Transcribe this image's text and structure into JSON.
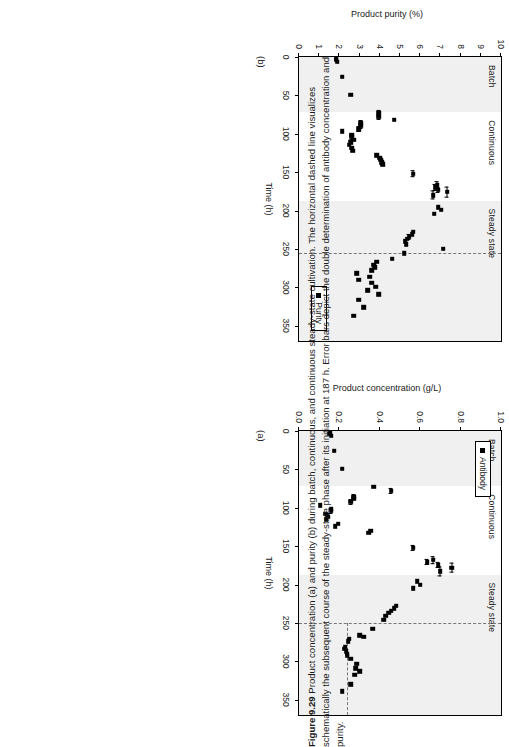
{
  "figure": {
    "number": "Figure 9.29",
    "caption_text": " Product concentration (a) and purity (b) during batch, continuous, and continuous steady-state cultivation. The horizontal dashed line visualizes schematically the subsequent course of the steady-state phase after its initiation at 187 h. Error bars depict the double determination of antibody concentration and purity."
  },
  "panel_a": {
    "tag": "(a)",
    "legend_label": "Antibody",
    "bands": [
      {
        "label": "Batch"
      },
      {
        "label": "Continuous"
      },
      {
        "label": "Steady state"
      }
    ],
    "xticks": [
      "0",
      "50",
      "100",
      "150",
      "200",
      "250",
      "300",
      "350"
    ],
    "yticks": [
      "0.0",
      "0.2",
      "0.4",
      "0.6",
      "0.8",
      "1.0"
    ]
  },
  "panel_b": {
    "tag": "(b)",
    "legend_label": "Purity",
    "bands": [
      {
        "label": "Batch"
      },
      {
        "label": "Continuous"
      },
      {
        "label": "Steady state"
      }
    ],
    "xticks": [
      "0",
      "50",
      "100",
      "150",
      "200",
      "250",
      "300",
      "350"
    ],
    "yticks": [
      "0",
      "1",
      "2",
      "3",
      "4",
      "5",
      "6",
      "7",
      "8",
      "9",
      "10"
    ]
  },
  "chart_data": [
    {
      "type": "scatter",
      "panel": "(a)",
      "title": "",
      "xlabel": "Time (h)",
      "ylabel": "Product concentration (g/L)",
      "xlim": [
        0,
        370
      ],
      "ylim": [
        0.0,
        1.0
      ],
      "grid": false,
      "legend_position": "top-left",
      "series": [
        {
          "name": "Antibody",
          "marker": "filled-square",
          "color": "#000000",
          "points": [
            {
              "x": 2,
              "y": 0.155
            },
            {
              "x": 4,
              "y": 0.15
            },
            {
              "x": 6,
              "y": 0.16
            },
            {
              "x": 26,
              "y": 0.175
            },
            {
              "x": 49,
              "y": 0.215
            },
            {
              "x": 73,
              "y": 0.37,
              "xerr": 0
            },
            {
              "x": 78,
              "y": 0.455,
              "xerr": 4
            },
            {
              "x": 86,
              "y": 0.27,
              "xerr": 3
            },
            {
              "x": 88,
              "y": 0.27
            },
            {
              "x": 92,
              "y": 0.255,
              "xerr": 3
            },
            {
              "x": 97,
              "y": 0.105
            },
            {
              "x": 101,
              "y": 0.16
            },
            {
              "x": 104,
              "y": 0.16,
              "xerr": 3
            },
            {
              "x": 108,
              "y": 0.13
            },
            {
              "x": 110,
              "y": 0.14
            },
            {
              "x": 112,
              "y": 0.145
            },
            {
              "x": 115,
              "y": 0.135
            },
            {
              "x": 121,
              "y": 0.195
            },
            {
              "x": 124,
              "y": 0.18
            },
            {
              "x": 130,
              "y": 0.355
            },
            {
              "x": 133,
              "y": 0.345
            },
            {
              "x": 152,
              "y": 0.565,
              "xerr": 4
            },
            {
              "x": 168,
              "y": 0.665,
              "xerr": 5
            },
            {
              "x": 171,
              "y": 0.635,
              "xerr": 4
            },
            {
              "x": 175,
              "y": 0.69,
              "xerr": 4
            },
            {
              "x": 178,
              "y": 0.755,
              "xerr": 7
            },
            {
              "x": 183,
              "y": 0.7,
              "xerr": 6
            },
            {
              "x": 196,
              "y": 0.585
            },
            {
              "x": 200,
              "y": 0.6
            },
            {
              "x": 205,
              "y": 0.565
            },
            {
              "x": 228,
              "y": 0.48
            },
            {
              "x": 231,
              "y": 0.47
            },
            {
              "x": 234,
              "y": 0.455
            },
            {
              "x": 237,
              "y": 0.445
            },
            {
              "x": 241,
              "y": 0.43
            },
            {
              "x": 246,
              "y": 0.42
            },
            {
              "x": 258,
              "y": 0.365
            },
            {
              "x": 266,
              "y": 0.3
            },
            {
              "x": 268,
              "y": 0.32
            },
            {
              "x": 271,
              "y": 0.25
            },
            {
              "x": 274,
              "y": 0.245
            },
            {
              "x": 281,
              "y": 0.23
            },
            {
              "x": 284,
              "y": 0.225
            },
            {
              "x": 287,
              "y": 0.235
            },
            {
              "x": 290,
              "y": 0.24
            },
            {
              "x": 293,
              "y": 0.24
            },
            {
              "x": 297,
              "y": 0.255
            },
            {
              "x": 303,
              "y": 0.285
            },
            {
              "x": 309,
              "y": 0.28
            },
            {
              "x": 313,
              "y": 0.3
            },
            {
              "x": 318,
              "y": 0.275
            },
            {
              "x": 330,
              "y": 0.255
            },
            {
              "x": 339,
              "y": 0.215
            }
          ]
        }
      ],
      "annotations": [
        {
          "type": "band",
          "label": "Batch",
          "x_range": [
            0,
            72
          ],
          "shaded": true
        },
        {
          "type": "band",
          "label": "Continuous",
          "x_range": [
            72,
            187
          ],
          "shaded": false
        },
        {
          "type": "band",
          "label": "Steady state",
          "x_range": [
            187,
            370
          ],
          "shaded": true
        },
        {
          "type": "dashed-horizontal",
          "y": 0.245,
          "x_range": [
            250,
            370
          ]
        },
        {
          "type": "dashed-vertical",
          "x": 250
        }
      ]
    },
    {
      "type": "scatter",
      "panel": "(b)",
      "title": "",
      "xlabel": "Time (h)",
      "ylabel": "Product purity (%)",
      "xlim": [
        0,
        370
      ],
      "ylim": [
        0,
        10
      ],
      "grid": false,
      "legend_position": "bottom-right",
      "series": [
        {
          "name": "Purity",
          "marker": "filled-square",
          "color": "#000000",
          "points": [
            {
              "x": 2,
              "y": 1.85
            },
            {
              "x": 4,
              "y": 1.85
            },
            {
              "x": 6,
              "y": 1.9
            },
            {
              "x": 26,
              "y": 2.15
            },
            {
              "x": 49,
              "y": 2.55
            },
            {
              "x": 73,
              "y": 3.95,
              "xerr": 4
            },
            {
              "x": 78,
              "y": 3.95,
              "xerr": 4
            },
            {
              "x": 82,
              "y": 4.7
            },
            {
              "x": 86,
              "y": 3.05,
              "xerr": 3
            },
            {
              "x": 90,
              "y": 3.05,
              "xerr": 3
            },
            {
              "x": 94,
              "y": 2.95,
              "xerr": 3
            },
            {
              "x": 97,
              "y": 2.15
            },
            {
              "x": 101,
              "y": 2.6
            },
            {
              "x": 104,
              "y": 2.6,
              "xerr": 3
            },
            {
              "x": 108,
              "y": 2.7
            },
            {
              "x": 111,
              "y": 2.55
            },
            {
              "x": 114,
              "y": 2.5
            },
            {
              "x": 118,
              "y": 2.6
            },
            {
              "x": 122,
              "y": 2.65
            },
            {
              "x": 128,
              "y": 3.85
            },
            {
              "x": 131,
              "y": 4.0
            },
            {
              "x": 134,
              "y": 4.05
            },
            {
              "x": 137,
              "y": 4.1
            },
            {
              "x": 140,
              "y": 4.15
            },
            {
              "x": 152,
              "y": 5.65,
              "xerr": 5
            },
            {
              "x": 167,
              "y": 6.85,
              "xerr": 5
            },
            {
              "x": 170,
              "y": 6.75,
              "xerr": 4
            },
            {
              "x": 173,
              "y": 6.9,
              "xerr": 4
            },
            {
              "x": 176,
              "y": 7.35,
              "xerr": 7
            },
            {
              "x": 180,
              "y": 6.65,
              "xerr": 6
            },
            {
              "x": 196,
              "y": 6.9
            },
            {
              "x": 199,
              "y": 7.05
            },
            {
              "x": 204,
              "y": 6.7
            },
            {
              "x": 228,
              "y": 5.65
            },
            {
              "x": 231,
              "y": 5.6
            },
            {
              "x": 234,
              "y": 5.45,
              "xerr": 4
            },
            {
              "x": 237,
              "y": 5.35
            },
            {
              "x": 240,
              "y": 5.25
            },
            {
              "x": 244,
              "y": 5.3
            },
            {
              "x": 250,
              "y": 7.15
            },
            {
              "x": 256,
              "y": 5.2
            },
            {
              "x": 263,
              "y": 4.6
            },
            {
              "x": 267,
              "y": 3.85
            },
            {
              "x": 271,
              "y": 3.7
            },
            {
              "x": 274,
              "y": 3.75
            },
            {
              "x": 278,
              "y": 3.6
            },
            {
              "x": 282,
              "y": 2.85
            },
            {
              "x": 286,
              "y": 3.5
            },
            {
              "x": 290,
              "y": 2.95
            },
            {
              "x": 294,
              "y": 3.6
            },
            {
              "x": 299,
              "y": 3.8
            },
            {
              "x": 304,
              "y": 3.4
            },
            {
              "x": 309,
              "y": 3.95
            },
            {
              "x": 316,
              "y": 2.95
            },
            {
              "x": 326,
              "y": 3.2
            },
            {
              "x": 337,
              "y": 2.7
            }
          ]
        }
      ],
      "annotations": [
        {
          "type": "band",
          "label": "Batch",
          "x_range": [
            0,
            72
          ],
          "shaded": true
        },
        {
          "type": "band",
          "label": "Continuous",
          "x_range": [
            72,
            187
          ],
          "shaded": false
        },
        {
          "type": "band",
          "label": "Steady state",
          "x_range": [
            187,
            370
          ],
          "shaded": true
        },
        {
          "type": "dashed-vertical",
          "x": 255
        }
      ]
    }
  ]
}
